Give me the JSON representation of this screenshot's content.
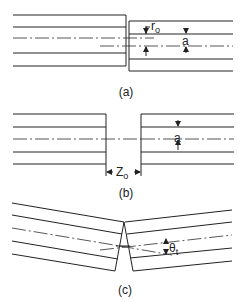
{
  "figure": {
    "panel_a": {
      "caption": "(a)",
      "label_r": "r",
      "label_r_sub": "o",
      "label_a": "a",
      "description": "Lateral (transverse) offset between two fibers"
    },
    "panel_b": {
      "caption": "(b)",
      "label_a": "a",
      "label_z": "Z",
      "label_z_sub": "o",
      "description": "Longitudinal (end) separation between two fibers"
    },
    "panel_c": {
      "caption": "(c)",
      "label_theta": "θ",
      "label_theta_sub": "t",
      "description": "Angular (tilt) misalignment between two fibers"
    }
  }
}
